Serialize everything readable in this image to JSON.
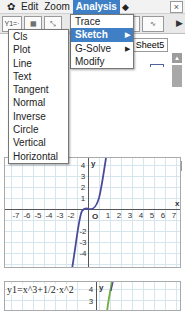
{
  "menubar": {
    "settings_icon": "gear-icon",
    "items": [
      {
        "label": "Edit"
      },
      {
        "label": "Zoom"
      },
      {
        "label": "Analysis",
        "active": true
      }
    ],
    "extra_icon": "diamond-icon",
    "close_label": "×"
  },
  "toolbar": {
    "buttons": [
      {
        "name": "y-equals-button",
        "label": "Y1=·"
      },
      {
        "name": "table-button",
        "label": "▦"
      },
      {
        "name": "graph-zoom-button",
        "label": "⤡"
      },
      {
        "name": "sketch-button",
        "label": "⌂"
      },
      {
        "name": "graph-xy-button",
        "label": "∿"
      }
    ],
    "more_label": "▶"
  },
  "list": {
    "sheet_tab": "Sheet5"
  },
  "analysis_menu": {
    "items": [
      {
        "label": "Trace",
        "submenu": false
      },
      {
        "label": "Sketch",
        "submenu": true,
        "selected": true
      },
      {
        "label": "G-Solve",
        "submenu": true
      },
      {
        "label": "Modify",
        "submenu": false
      }
    ]
  },
  "sketch_menu": {
    "items": [
      {
        "label": "Cls"
      },
      {
        "label": "Plot"
      },
      {
        "label": "Line"
      },
      {
        "label": "Text"
      },
      {
        "label": "Tangent"
      },
      {
        "label": "Normal"
      },
      {
        "label": "Inverse"
      },
      {
        "label": "Circle"
      },
      {
        "label": "Vertical"
      },
      {
        "label": "Horizontal"
      }
    ]
  },
  "graph_top": {
    "x_label": "x",
    "y_label": "y",
    "origin_label": "O",
    "x_ticks": [
      "-7",
      "-6",
      "-5",
      "-4",
      "-3",
      "-2",
      "1",
      "2",
      "3",
      "4",
      "5",
      "6",
      "7"
    ],
    "y_ticks_pos": [
      "4",
      "3",
      "2",
      "1"
    ],
    "y_ticks_neg": [
      "-2",
      "-3",
      "-4"
    ],
    "curve_color": "#4a4a9a"
  },
  "graph_bottom": {
    "formula": "y1=x^3+1/2·x^2",
    "y_tick": "4",
    "y_tick2": "3",
    "y_label": "y",
    "curve_color": "#6fae3a"
  }
}
